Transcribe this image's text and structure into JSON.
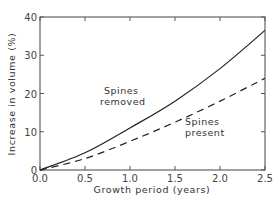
{
  "chart_data": {
    "type": "line",
    "title": "",
    "xlabel": "Growth period (years)",
    "ylabel": "Increase in volume  (%)",
    "xlim": [
      0.0,
      2.5
    ],
    "ylim": [
      0,
      40
    ],
    "x_ticks": [
      "0.0",
      "0.5",
      "1.0",
      "1.5",
      "2.0",
      "2.5"
    ],
    "y_ticks": [
      "0",
      "10",
      "20",
      "30",
      "40"
    ],
    "grid": false,
    "legend": "none (inline annotations)",
    "x": [
      0.0,
      0.5,
      1.0,
      1.5,
      2.0,
      2.5
    ],
    "series": [
      {
        "name": "Spines removed",
        "style": "solid",
        "values": [
          0,
          4.5,
          11,
          18,
          26.5,
          36.5
        ]
      },
      {
        "name": "Spines present",
        "style": "dashed",
        "values": [
          0,
          3,
          7.5,
          12.5,
          18,
          24
        ]
      }
    ],
    "annotations": [
      {
        "text_line1": "Spines",
        "text_line2": "removed",
        "series": "Spines removed"
      },
      {
        "text_line1": "Spines",
        "text_line2": "present",
        "series": "Spines present"
      }
    ]
  },
  "layout": {
    "plot": {
      "left": 40,
      "right": 265,
      "top": 17,
      "bottom": 170
    },
    "line_color": "#222222",
    "axis_color": "#555555"
  }
}
